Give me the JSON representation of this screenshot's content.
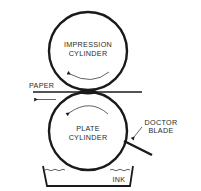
{
  "diagram": {
    "type": "gravure-printing-press",
    "colors": {
      "background": "#ffffff",
      "line": "#1a1a1a",
      "text": "#2a2a2a"
    },
    "labels": {
      "impression_line1": "IMPRESSION",
      "impression_line2": "CYLINDER",
      "plate_line1": "PLATE",
      "plate_line2": "CYLINDER",
      "paper": "PAPER",
      "doctor_line1": "DOCTOR",
      "doctor_line2": "BLADE",
      "ink": "INK"
    },
    "components": [
      {
        "name": "impression-cylinder",
        "rotation": "counterclockwise"
      },
      {
        "name": "plate-cylinder",
        "rotation": "counterclockwise"
      },
      {
        "name": "paper",
        "direction": "left"
      },
      {
        "name": "doctor-blade"
      },
      {
        "name": "ink-tray"
      }
    ]
  }
}
